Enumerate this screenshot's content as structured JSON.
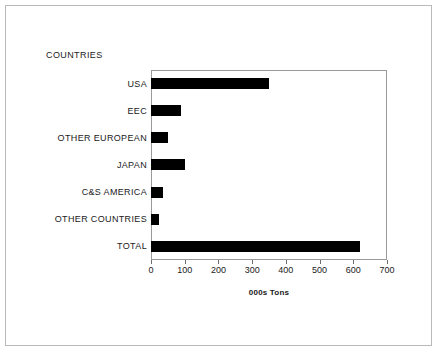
{
  "chart_data": {
    "type": "bar",
    "orientation": "horizontal",
    "title": "",
    "categories_axis_title": "COUNTRIES",
    "categories": [
      "USA",
      "EEC",
      "OTHER EUROPEAN",
      "JAPAN",
      "C&S AMERICA",
      "OTHER COUNTRIES",
      "TOTAL"
    ],
    "values": [
      350,
      90,
      50,
      100,
      35,
      25,
      620
    ],
    "xlabel": "000s Tons",
    "ylabel": "COUNTRIES",
    "xlim": [
      0,
      700
    ],
    "xticks": [
      0,
      100,
      200,
      300,
      400,
      500,
      600,
      700
    ],
    "xtick_labels": [
      "0",
      "100",
      "200",
      "300",
      "400",
      "500",
      "600",
      "700"
    ],
    "grid": false,
    "legend": false,
    "bar_color": "#000000",
    "plot_border_color": "#9a9a9a",
    "frame_color": "#b9b9b9",
    "background": "#ffffff"
  }
}
